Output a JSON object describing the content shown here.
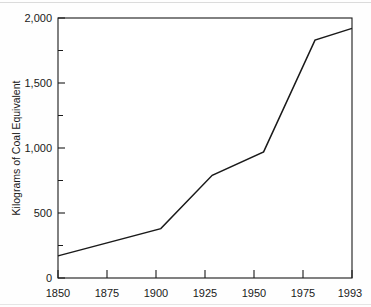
{
  "chart_data": {
    "type": "line",
    "title": "",
    "subtitle": "",
    "xlabel": "",
    "ylabel": "Kilograms of Coal Equivalent",
    "x": [
      1850,
      1900,
      1925,
      1950,
      1975,
      1993
    ],
    "values": [
      170,
      380,
      790,
      970,
      1830,
      1920
    ],
    "series": [
      {
        "name": "Per capita energy consumption",
        "x": [
          1850,
          1900,
          1925,
          1950,
          1975,
          1993
        ],
        "values": [
          170,
          380,
          790,
          970,
          1830,
          1920
        ]
      }
    ],
    "xlim": [
      1850,
      1993
    ],
    "ylim": [
      0,
      2000
    ],
    "xtick_labels": [
      "1850",
      "1875",
      "1900",
      "1925",
      "1950",
      "1975",
      "1993"
    ],
    "xtick_values": [
      1850,
      1875,
      1900,
      1925,
      1950,
      1975,
      1993
    ],
    "ytick_labels": [
      "0",
      "500",
      "1,000",
      "1,500",
      "2,000"
    ],
    "ytick_values": [
      0,
      500,
      1000,
      1500,
      2000
    ],
    "yminor_values": [
      250,
      750,
      1250,
      1750
    ],
    "grid": false,
    "legend": false,
    "legend_position": "none",
    "line_color": "#1a1a1a",
    "background_color": "#ffffff",
    "annotations": []
  },
  "axes": {
    "y_title": "Kilograms of Coal Equivalent",
    "x_title": ""
  },
  "colors": {
    "line": "#1a1a1a",
    "frame": "#1a1a1a",
    "text": "#1a1a1a",
    "background": "#ffffff"
  }
}
